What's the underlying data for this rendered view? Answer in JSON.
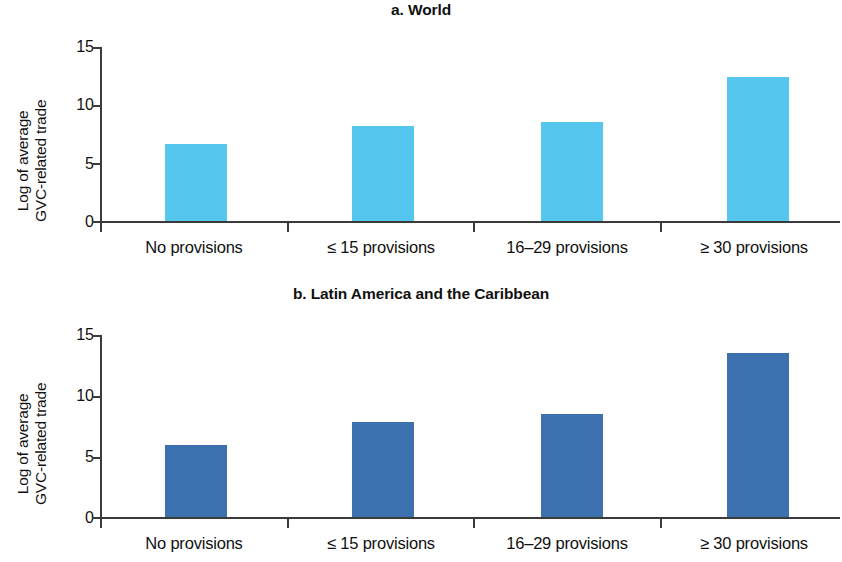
{
  "figure": {
    "background": "#ffffff",
    "width": 842,
    "height": 562
  },
  "chart_data": [
    {
      "type": "bar",
      "title": "a. World",
      "panel_letter": "a.",
      "categories": [
        "No provisions",
        "≤ 15 provisions",
        "16–29 provisions",
        "≥ 30 provisions"
      ],
      "values": [
        6.6,
        8.2,
        8.5,
        12.4
      ],
      "xlabel": "",
      "ylabel": "Log of average GVC-related trade",
      "ylabel_line1": "Log of average",
      "ylabel_line2": "GVC-related trade",
      "ylim": [
        0,
        15
      ],
      "yticks": [
        0,
        5,
        10,
        15
      ],
      "ytick_labels": [
        "0",
        "5",
        "10",
        "15"
      ],
      "grid": false,
      "legend": "none",
      "bar_color": "#55c7ee",
      "axis_color": "#3a3a3a"
    },
    {
      "type": "bar",
      "title": "b. Latin America and the Caribbean",
      "panel_letter": "b.",
      "categories": [
        "No provisions",
        "≤ 15 provisions",
        "16–29 provisions",
        "≥ 30 provisions"
      ],
      "values": [
        5.9,
        7.8,
        8.5,
        13.5
      ],
      "xlabel": "",
      "ylabel": "Log of average GVC-related trade",
      "ylabel_line1": "Log of average",
      "ylabel_line2": "GVC-related trade",
      "ylim": [
        0,
        15
      ],
      "yticks": [
        0,
        5,
        10,
        15
      ],
      "ytick_labels": [
        "0",
        "5",
        "10",
        "15"
      ],
      "grid": false,
      "legend": "none",
      "bar_color": "#3c70ae",
      "axis_color": "#3a3a3a"
    }
  ]
}
